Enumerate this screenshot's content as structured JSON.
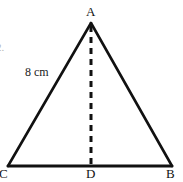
{
  "figure": {
    "type": "geometry-diagram",
    "shape": "isosceles-triangle-with-altitude",
    "background_color": "#ffffff",
    "stroke_color": "#111111",
    "labels": {
      "apex": "A",
      "base_left": "C",
      "base_right": "B",
      "altitude_foot": "D",
      "side_length": "8 cm"
    },
    "clipped_margin_text": "2.",
    "geometry": {
      "apex_point": [
        91,
        23
      ],
      "base_left_point": [
        8,
        166
      ],
      "base_right_point": [
        172,
        166
      ],
      "altitude_foot_point": [
        91,
        166
      ],
      "side_stroke_width": 2.6,
      "base_stroke_width": 3.0,
      "altitude_stroke_width": 3.0,
      "altitude_dash": "6 5",
      "altitude_style": "dashed"
    }
  }
}
